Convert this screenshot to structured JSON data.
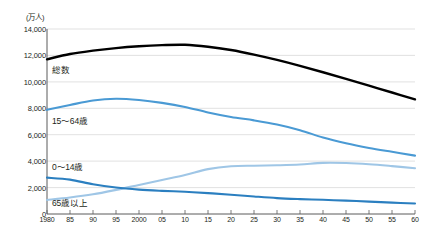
{
  "chart_data": {
    "type": "line",
    "title": "",
    "unit_label": "(万人)",
    "xlabel": "",
    "ylabel": "",
    "grid": true,
    "legend_position": "inline-labels",
    "ylim": [
      0,
      14000
    ],
    "yticks": [
      0,
      2000,
      4000,
      6000,
      8000,
      10000,
      12000,
      14000
    ],
    "ytick_labels": [
      "0",
      "2,000",
      "4,000",
      "6,000",
      "8,000",
      "10,000",
      "12,000",
      "14,000"
    ],
    "xlim": [
      1980,
      2060
    ],
    "xticks": [
      1980,
      1985,
      1990,
      1995,
      2000,
      2005,
      2010,
      2015,
      2020,
      2025,
      2030,
      2035,
      2040,
      2045,
      2050,
      2055,
      2060
    ],
    "xtick_labels": [
      "1980",
      "85",
      "90",
      "95",
      "2000",
      "05",
      "10",
      "15",
      "20",
      "25",
      "30",
      "35",
      "40",
      "45",
      "50",
      "55",
      "60"
    ],
    "x": [
      1980,
      1985,
      1990,
      1995,
      2000,
      2005,
      2010,
      2015,
      2020,
      2025,
      2030,
      2035,
      2040,
      2045,
      2050,
      2055,
      2060
    ],
    "series": [
      {
        "name": "総数",
        "color": "#000000",
        "values": [
          11706,
          12105,
          12361,
          12557,
          12693,
          12777,
          12806,
          12660,
          12410,
          12066,
          11662,
          11212,
          10728,
          10221,
          9708,
          9193,
          8674
        ]
      },
      {
        "name": "15～64歳",
        "color": "#4a9ad4",
        "values": [
          7884,
          8251,
          8590,
          8716,
          8622,
          8409,
          8103,
          7682,
          7341,
          7085,
          6773,
          6343,
          5787,
          5353,
          5001,
          4706,
          4418
        ]
      },
      {
        "name": "0～14歳",
        "color": "#2b7fc0",
        "values": [
          2751,
          2603,
          2249,
          2001,
          1847,
          1752,
          1680,
          1583,
          1457,
          1324,
          1204,
          1129,
          1073,
          1012,
          939,
          861,
          791
        ]
      },
      {
        "name": "65歳以上",
        "color": "#9fc6e6",
        "values": [
          1065,
          1247,
          1489,
          1826,
          2201,
          2576,
          2948,
          3395,
          3612,
          3657,
          3685,
          3741,
          3868,
          3856,
          3768,
          3626,
          3464
        ]
      }
    ]
  },
  "labels": {
    "total": "総数",
    "working_age": "15～64歳",
    "children": "0～14歳",
    "elderly": "65歳以上"
  }
}
